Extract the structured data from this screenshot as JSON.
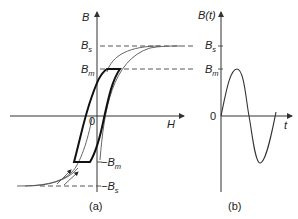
{
  "panel_a": {
    "y_axis_label": "B",
    "x_axis_label": "H",
    "origin_label": "0",
    "bs_label": "B",
    "bs_sub": "s",
    "bm_label": "B",
    "bm_sub": "m",
    "neg_bm_label": "−B",
    "neg_bm_sub": "m",
    "neg_bs_label": "−B",
    "neg_bs_sub": "s",
    "caption": "(a)"
  },
  "panel_b": {
    "y_axis_label": "B(t)",
    "x_axis_label": "t",
    "origin_label": "0",
    "bs_label": "B",
    "bs_sub": "s",
    "bm_label": "B",
    "bm_sub": "m",
    "caption": "(b)"
  }
}
